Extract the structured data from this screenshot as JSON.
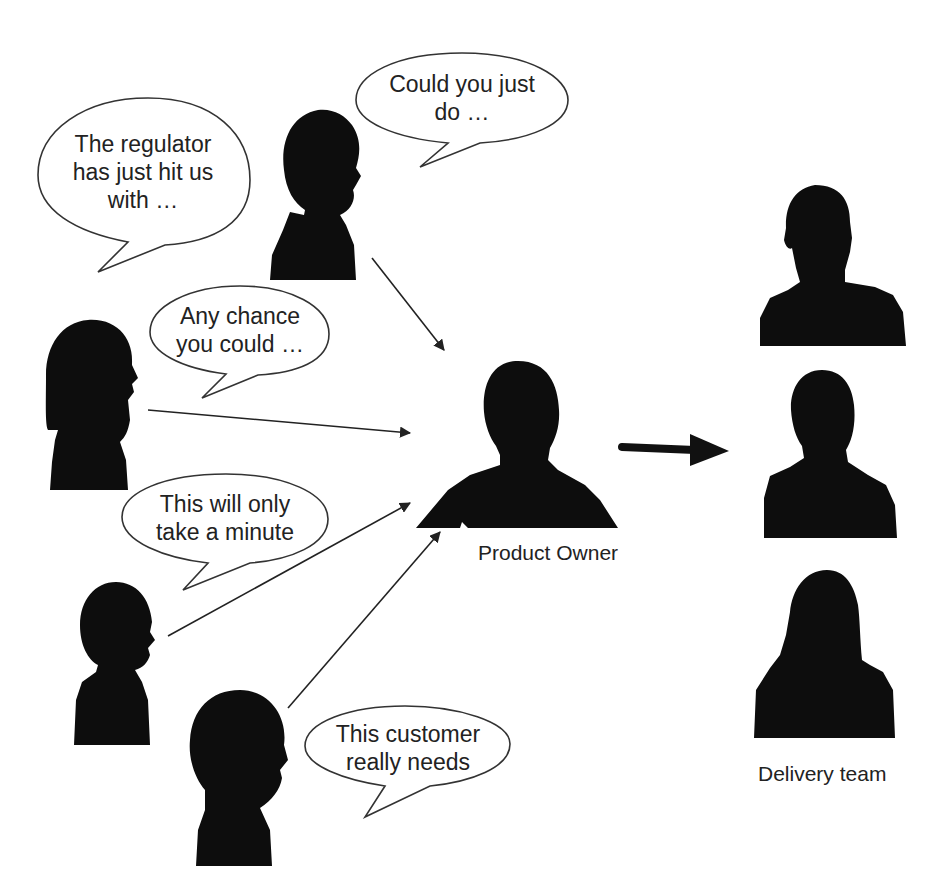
{
  "diagram": {
    "stakeholders": [
      {
        "id": "regulator-stakeholder",
        "bubble_lines": [
          "The regulator",
          "has just hit us",
          "with …"
        ]
      },
      {
        "id": "could-you-stakeholder",
        "bubble_lines": [
          "Could you just",
          "do …"
        ]
      },
      {
        "id": "any-chance-stakeholder",
        "bubble_lines": [
          "Any chance",
          "you could …"
        ]
      },
      {
        "id": "minute-stakeholder",
        "bubble_lines": [
          "This will only",
          "take a minute"
        ]
      },
      {
        "id": "customer-stakeholder",
        "bubble_lines": [
          "This customer",
          "really needs"
        ]
      }
    ],
    "product_owner": {
      "label": "Product Owner"
    },
    "delivery_team": {
      "label": "Delivery team",
      "member_count": 3
    },
    "colors": {
      "silhouette": "#0d0d0d",
      "line": "#222222",
      "bubble_fill": "#ffffff"
    }
  }
}
